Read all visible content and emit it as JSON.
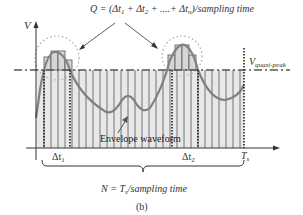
{
  "diagram": {
    "formula_q": {
      "prefix": "Q = (Δt",
      "sub1": "1",
      "mid1": " + Δt",
      "sub2": "2",
      "mid2": " + ....+ Δt",
      "subn": "n",
      "suffix": ")/sampling time"
    },
    "y_axis_label": "V",
    "quasi_peak_label": {
      "main": "V",
      "sub": "quasi-peak"
    },
    "envelope_label": "Envelope waveform",
    "x_labels": [
      {
        "main": "Δt",
        "sub": "1"
      },
      {
        "main": "Δt",
        "sub": "2"
      },
      {
        "main": "T",
        "sub": "s"
      }
    ],
    "formula_n": {
      "prefix": "N = T",
      "sub": "s",
      "suffix": "/sampling time"
    },
    "caption": "(b)",
    "colors": {
      "axis": "#333333",
      "bars_fill": "#e6e6e6",
      "bars_stroke": "#555555",
      "envelope": "#808080",
      "dotted_circle": "#aaaaaa",
      "text": "#333333"
    }
  }
}
